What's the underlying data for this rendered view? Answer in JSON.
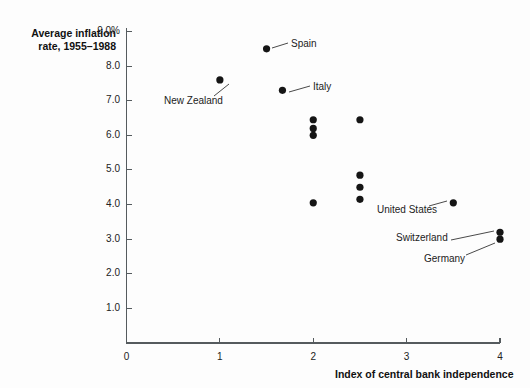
{
  "chart_data": {
    "type": "scatter",
    "title": "",
    "ylabel_line1": "Average inflation",
    "ylabel_line2": "rate, 1955–1988",
    "xlabel": "Index of central bank independence",
    "xlim": [
      0,
      4
    ],
    "ylim": [
      0,
      9
    ],
    "grid": false,
    "legend": "none",
    "x_ticks": [
      {
        "value": 0,
        "label": "0"
      },
      {
        "value": 1,
        "label": "1"
      },
      {
        "value": 2,
        "label": "2"
      },
      {
        "value": 3,
        "label": "3"
      },
      {
        "value": 4,
        "label": "4"
      }
    ],
    "y_ticks": [
      {
        "value": 9.0,
        "label": "9.0%"
      },
      {
        "value": 8.0,
        "label": "8.0"
      },
      {
        "value": 7.0,
        "label": "7.0"
      },
      {
        "value": 6.0,
        "label": "6.0"
      },
      {
        "value": 5.0,
        "label": "5.0"
      },
      {
        "value": 4.0,
        "label": "4.0"
      },
      {
        "value": 3.0,
        "label": "3.0"
      },
      {
        "value": 2.0,
        "label": "2.0"
      },
      {
        "value": 1.0,
        "label": "1.0"
      }
    ],
    "points": [
      {
        "x": 1.0,
        "y": 7.6,
        "label": "New Zealand"
      },
      {
        "x": 1.5,
        "y": 8.5,
        "label": "Spain"
      },
      {
        "x": 1.67,
        "y": 7.3,
        "label": "Italy"
      },
      {
        "x": 2.0,
        "y": 6.45,
        "label": ""
      },
      {
        "x": 2.0,
        "y": 6.2,
        "label": ""
      },
      {
        "x": 2.0,
        "y": 6.0,
        "label": ""
      },
      {
        "x": 2.0,
        "y": 4.05,
        "label": ""
      },
      {
        "x": 2.5,
        "y": 6.45,
        "label": ""
      },
      {
        "x": 2.5,
        "y": 4.85,
        "label": ""
      },
      {
        "x": 2.5,
        "y": 4.5,
        "label": ""
      },
      {
        "x": 2.5,
        "y": 4.15,
        "label": ""
      },
      {
        "x": 3.5,
        "y": 4.05,
        "label": "United States"
      },
      {
        "x": 4.0,
        "y": 3.2,
        "label": "Switzerland"
      },
      {
        "x": 4.0,
        "y": 3.0,
        "label": "Germany"
      }
    ],
    "annotations": [
      {
        "name": "new-zealand",
        "text": "New Zealand",
        "text_x": 164,
        "text_y": 95,
        "leader_x1": 214,
        "leader_y1": 96,
        "leader_x2": 229,
        "leader_y2": 84
      },
      {
        "name": "spain",
        "text": "Spain",
        "text_x": 291,
        "text_y": 38,
        "leader_x1": 272,
        "leader_y1": 48,
        "leader_x2": 288,
        "leader_y2": 43
      },
      {
        "name": "italy",
        "text": "Italy",
        "text_x": 313,
        "text_y": 81,
        "leader_x1": 289,
        "leader_y1": 92,
        "leader_x2": 310,
        "leader_y2": 86
      },
      {
        "name": "united-states",
        "text": "United States",
        "text_x": 377,
        "text_y": 204,
        "leader_x1": 429,
        "leader_y1": 206,
        "leader_x2": 447,
        "leader_y2": 201
      },
      {
        "name": "switzerland",
        "text": "Switzerland",
        "text_x": 396,
        "text_y": 232,
        "leader_x1": 451,
        "leader_y1": 240,
        "leader_x2": 494,
        "leader_y2": 231
      },
      {
        "name": "germany",
        "text": "Germany",
        "text_x": 424,
        "text_y": 253,
        "leader_x1": 466,
        "leader_y1": 255,
        "leader_x2": 495,
        "leader_y2": 243
      }
    ],
    "colors": {
      "point": "#151515",
      "axis": "#555b5e",
      "text": "#222222",
      "background": "#fdfdfd"
    }
  }
}
